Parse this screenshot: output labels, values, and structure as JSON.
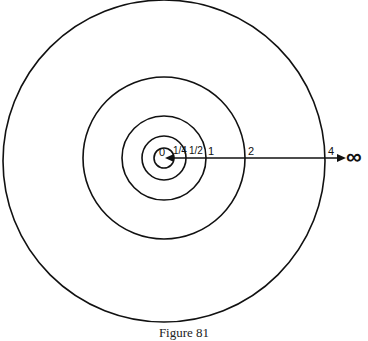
{
  "diagram": {
    "labels": {
      "zero": "0",
      "quarter": "1/4",
      "half": "1/2",
      "one": "1",
      "two": "2",
      "four": "4",
      "infinity": "∞"
    },
    "caption": "Figure 81"
  }
}
